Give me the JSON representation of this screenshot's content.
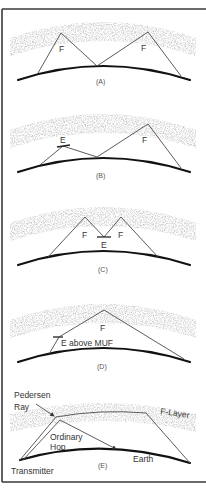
{
  "figure": {
    "colors": {
      "frame": "#3a3a3a",
      "earth": "#111111",
      "ray": "#4a4a4a",
      "ionosphere_haze": "#d6d6d6",
      "text": "#333333"
    },
    "panels": [
      {
        "id": "A",
        "caption": "(A)",
        "labels": {
          "f_left": "F",
          "f_right": "F"
        }
      },
      {
        "id": "B",
        "caption": "(B)",
        "labels": {
          "e": "E",
          "f": "F"
        }
      },
      {
        "id": "C",
        "caption": "(C)",
        "labels": {
          "f_left": "F",
          "e": "E",
          "f_right": "F"
        }
      },
      {
        "id": "D",
        "caption": "(D)",
        "labels": {
          "f": "F",
          "e_above_muf": "E above MUF"
        }
      },
      {
        "id": "E",
        "caption": "(E)",
        "labels": {
          "pedersen_line1": "Pedersen",
          "pedersen_line2": "Ray",
          "f_layer": "F-Layer",
          "ordinary_line1": "Ordinary",
          "ordinary_line2": "Hop",
          "earth": "Earth",
          "transmitter": "Transmitter"
        }
      }
    ]
  }
}
